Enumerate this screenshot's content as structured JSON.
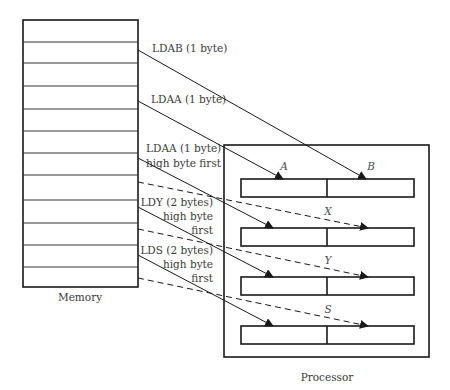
{
  "memory": {
    "caption": "Memory",
    "row_count": 12
  },
  "processor": {
    "caption": "Processor",
    "registers": [
      {
        "name": "A",
        "label_left": "A",
        "label_right": "B",
        "pair": "A|B"
      },
      {
        "name": "X",
        "label": "X"
      },
      {
        "name": "Y",
        "label": "Y"
      },
      {
        "name": "S",
        "label": "S"
      }
    ]
  },
  "instructions": [
    {
      "id": "ldab",
      "lines": [
        "LDAB (1 byte)"
      ],
      "target": "B",
      "style": "solid"
    },
    {
      "id": "ldaa",
      "lines": [
        "LDAA (1 byte)"
      ],
      "target": "A",
      "style": "solid"
    },
    {
      "id": "ldx",
      "lines": [
        "LDX (2 bytes)",
        "high byte first"
      ],
      "target": "X",
      "style": "solid+dashed"
    },
    {
      "id": "ldy",
      "lines": [
        "LDY (2 bytes)",
        "high byte",
        "first"
      ],
      "target": "Y",
      "style": "solid+dashed"
    },
    {
      "id": "lds",
      "lines": [
        "LDS (2 bytes)",
        "high byte",
        "first"
      ],
      "target": "S",
      "style": "solid+dashed"
    }
  ],
  "colors": {
    "stroke": "#1a1a1a",
    "text": "#3a3a3a",
    "background": "#ffffff"
  }
}
